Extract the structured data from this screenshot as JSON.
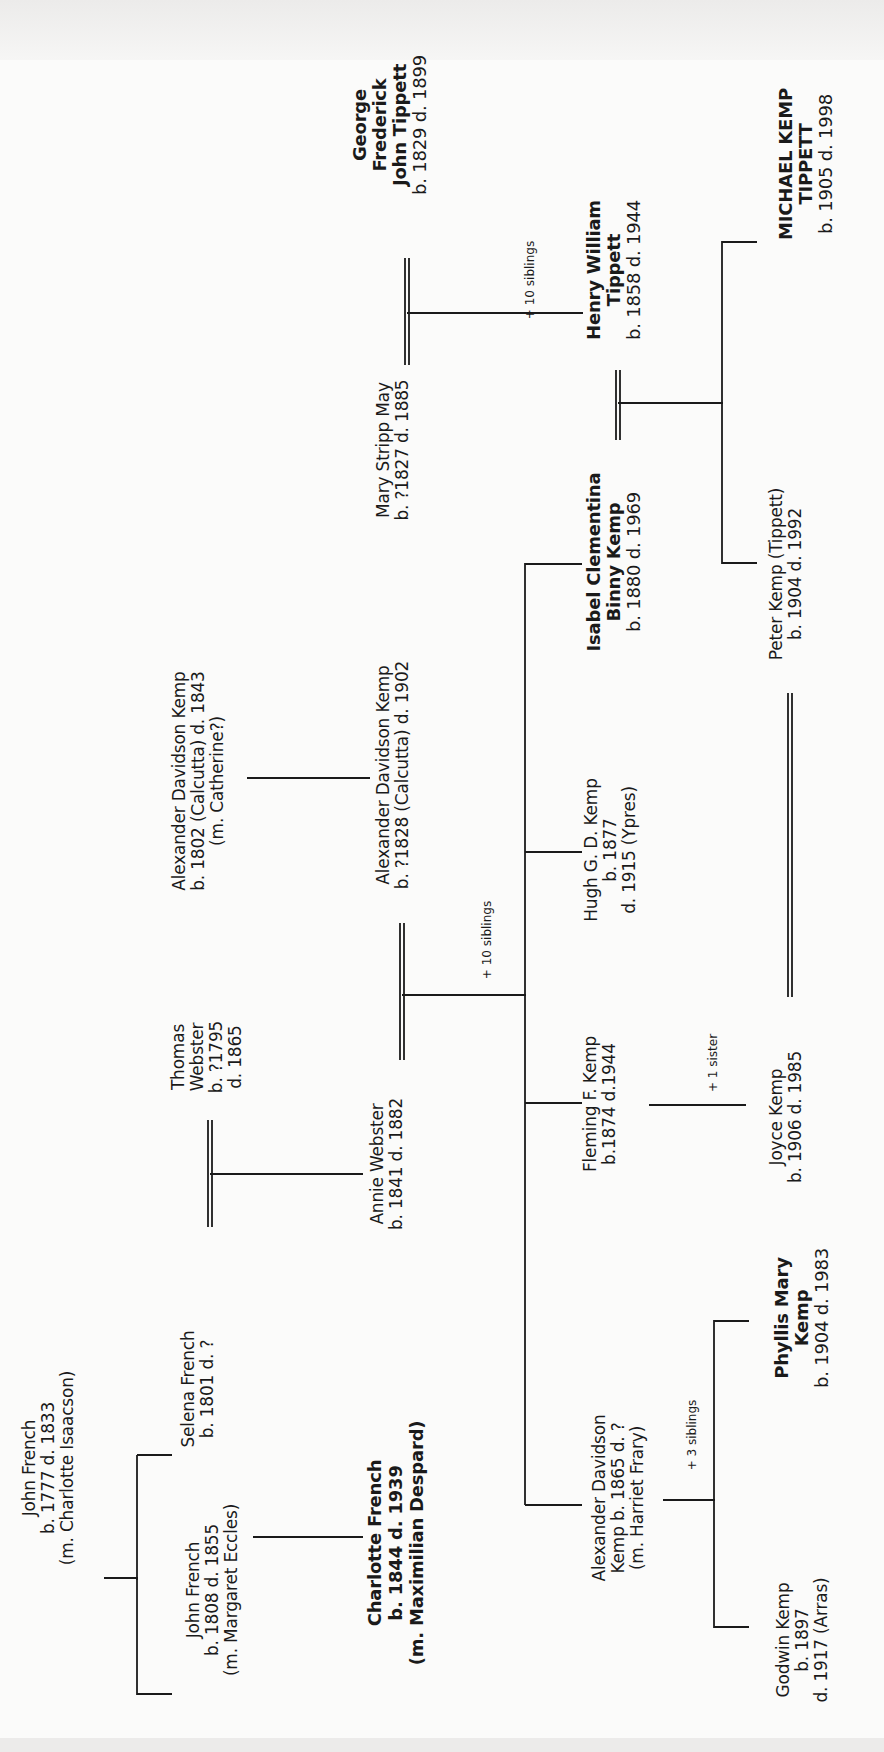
{
  "document": {
    "title": "Family tree of Michael Kemp Tippett",
    "orientation": "rotated 90° counter-clockwise"
  },
  "people": {
    "john_french_1777": {
      "lines": [
        "John French",
        "b. 1777 d. 1833",
        "(m. Charlotte Isaacson)"
      ]
    },
    "john_french_1808": {
      "lines": [
        "John French",
        "b. 1808 d. 1855",
        "(m. Margaret Eccles)"
      ]
    },
    "selena_french": {
      "lines": [
        "Selena French",
        "b. 1801 d. ?"
      ]
    },
    "charlotte_french": {
      "lines": [
        "Charlotte French",
        "b. 1844 d. 1939",
        "(m. Maximilian Despard)"
      ]
    },
    "thomas_webster": {
      "lines": [
        "Thomas",
        "Webster",
        "b. ?1795",
        "d. 1865"
      ]
    },
    "annie_webster": {
      "lines": [
        "Annie Webster",
        "b. 1841 d. 1882"
      ]
    },
    "alexander_kemp_1802": {
      "lines": [
        "Alexander Davidson Kemp",
        "b. 1802 (Calcutta) d. 1843",
        "(m. Catherine?)"
      ]
    },
    "alexander_kemp_1828": {
      "lines": [
        "Alexander Davidson Kemp",
        "b. ?1828 (Calcutta) d. 1902"
      ]
    },
    "mary_stripp_may": {
      "lines": [
        "Mary Stripp May",
        "b. ?1827 d. 1885"
      ]
    },
    "george_tippett": {
      "lines": [
        "George",
        "Frederick",
        "John Tippett",
        "b. 1829 d. 1899"
      ]
    },
    "henry_tippett": {
      "lines": [
        "Henry William",
        "Tippett",
        "b. 1858 d. 1944"
      ]
    },
    "isabel_kemp": {
      "lines": [
        "Isabel Clementina",
        "Binny Kemp",
        "b. 1880 d. 1969"
      ]
    },
    "hugh_kemp": {
      "lines": [
        "Hugh G. D. Kemp",
        "b. 1877",
        "d. 1915 (Ypres)"
      ]
    },
    "fleming_kemp": {
      "lines": [
        "Fleming F. Kemp",
        "b.1874 d.1944"
      ]
    },
    "alexander_kemp_1865": {
      "lines": [
        "Alexander Davidson",
        "Kemp b. 1865 d. ?",
        "(m. Harriet Frary)"
      ]
    },
    "michael_tippett": {
      "lines": [
        "MICHAEL KEMP",
        "TIPPETT",
        "b. 1905 d. 1998"
      ]
    },
    "peter_kemp": {
      "lines": [
        "Peter Kemp (Tippett)",
        "b. 1904 d. 1992"
      ]
    },
    "joyce_kemp": {
      "lines": [
        "Joyce Kemp",
        "b. 1906 d. 1985"
      ]
    },
    "phyllis_kemp": {
      "lines": [
        "Phyllis Mary",
        "Kemp",
        "b. 1904 d. 1983"
      ]
    },
    "godwin_kemp": {
      "lines": [
        "Godwin Kemp",
        "b. 1897",
        "d. 1917 (Arras)"
      ]
    }
  },
  "notes": {
    "tippett_siblings": "+ 10 siblings",
    "kemp_siblings": "+ 10 siblings",
    "joyce_sister": "+ 1 sister",
    "phyllis_siblings": "+ 3 siblings"
  },
  "colors": {
    "ink": "#1a1a1a",
    "paper": "#fbfbfa"
  }
}
